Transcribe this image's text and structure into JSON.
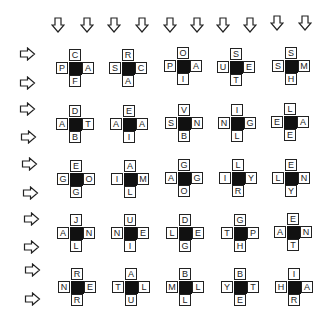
{
  "puzzle": {
    "top_arrow_count": 10,
    "left_arrow_count": 10,
    "grid": [
      [
        {
          "top": "C",
          "left": "P",
          "right": "A",
          "bottom": "F"
        },
        {
          "top": "R",
          "left": "S",
          "right": "C",
          "bottom": "A"
        },
        {
          "top": "O",
          "left": "P",
          "right": "A",
          "bottom": "I"
        },
        {
          "top": "S",
          "left": "U",
          "right": "E",
          "bottom": "T"
        },
        {
          "top": "S",
          "left": "S",
          "right": "M",
          "bottom": "H"
        }
      ],
      [
        {
          "top": "D",
          "left": "A",
          "right": "T",
          "bottom": "B"
        },
        {
          "top": "E",
          "left": "A",
          "right": "A",
          "bottom": "I"
        },
        {
          "top": "V",
          "left": "S",
          "right": "N",
          "bottom": "B"
        },
        {
          "top": "I",
          "left": "N",
          "right": "G",
          "bottom": "L"
        },
        {
          "top": "L",
          "left": "E",
          "right": "A",
          "bottom": "E"
        }
      ],
      [
        {
          "top": "E",
          "left": "G",
          "right": "O",
          "bottom": "G"
        },
        {
          "top": "A",
          "left": "I",
          "right": "M",
          "bottom": "L"
        },
        {
          "top": "G",
          "left": "A",
          "right": "G",
          "bottom": "O"
        },
        {
          "top": "L",
          "left": "I",
          "right": "Y",
          "bottom": "R"
        },
        {
          "top": "E",
          "left": "L",
          "right": "N",
          "bottom": "Y"
        }
      ],
      [
        {
          "top": "J",
          "left": "A",
          "right": "N",
          "bottom": "L"
        },
        {
          "top": "U",
          "left": "N",
          "right": "E",
          "bottom": "I"
        },
        {
          "top": "D",
          "left": "L",
          "right": "E",
          "bottom": "G"
        },
        {
          "top": "G",
          "left": "T",
          "right": "P",
          "bottom": "H"
        },
        {
          "top": "E",
          "left": "A",
          "right": "N",
          "bottom": "T"
        }
      ],
      [
        {
          "top": "R",
          "left": "N",
          "right": "E",
          "bottom": "R"
        },
        {
          "top": "A",
          "left": "T",
          "right": "L",
          "bottom": "U"
        },
        {
          "top": "B",
          "left": "M",
          "right": "L",
          "bottom": "L"
        },
        {
          "top": "B",
          "left": "Y",
          "right": "T",
          "bottom": "E"
        },
        {
          "top": "I",
          "left": "H",
          "right": "A",
          "bottom": "R"
        }
      ]
    ]
  }
}
